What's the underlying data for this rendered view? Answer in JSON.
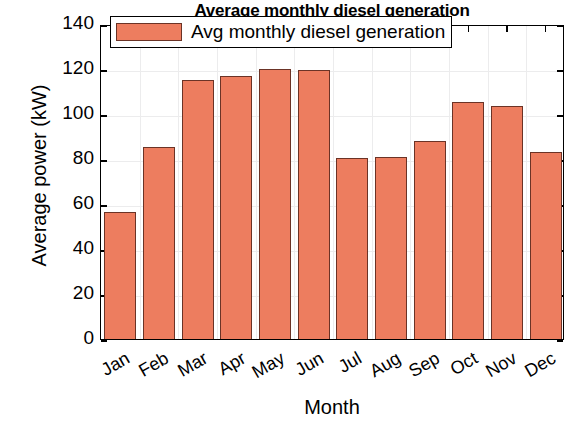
{
  "chart_data": {
    "type": "bar",
    "title": "Average monthly diesel generation",
    "xlabel": "Month",
    "ylabel": "Average power (kW)",
    "categories": [
      "Jan",
      "Feb",
      "Mar",
      "Apr",
      "May",
      "Jun",
      "Jul",
      "Aug",
      "Sep",
      "Oct",
      "Nov",
      "Dec"
    ],
    "values": [
      56.5,
      85.5,
      115,
      117,
      120,
      119.5,
      80.5,
      81,
      88,
      105.5,
      103.5,
      83
    ],
    "series": [
      {
        "name": "Avg monthly diesel generation",
        "values": [
          56.5,
          85.5,
          115,
          117,
          120,
          119.5,
          80.5,
          81,
          88,
          105.5,
          103.5,
          83
        ]
      }
    ],
    "ylim": [
      0,
      140
    ],
    "yticks": [
      0,
      20,
      40,
      60,
      80,
      100,
      120,
      140
    ],
    "ytick_labels": [
      "0",
      "20",
      "40",
      "60",
      "80",
      "100",
      "120",
      "140"
    ],
    "grid": true,
    "legend_position": "top-center",
    "legend_entries": [
      "Avg monthly diesel generation"
    ],
    "bar_color": "#ED7D5F",
    "bar_edge_color": "#6B3326",
    "bar_width_ratio": 0.82
  },
  "legend": {
    "label": "Avg monthly diesel generation"
  }
}
